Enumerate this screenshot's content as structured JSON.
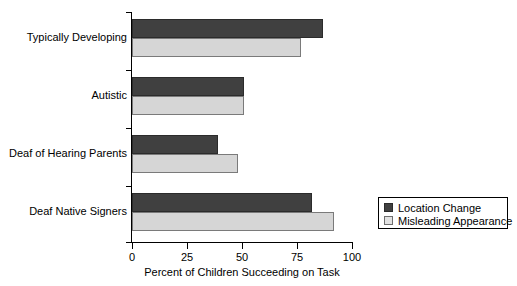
{
  "chart_data": {
    "type": "bar",
    "orientation": "horizontal",
    "title": "",
    "xlabel": "Percent of Children Succeeding on Task",
    "ylabel": "",
    "xlim": [
      0,
      100
    ],
    "xticks": [
      0,
      25,
      50,
      75,
      100
    ],
    "xtick_labels": [
      "0",
      "25",
      "50",
      "75",
      "100"
    ],
    "grid": false,
    "legend_position": "bottom-right",
    "categories": [
      "Typically Developing",
      "Autistic",
      "Deaf of Hearing Parents",
      "Deaf Native Signers"
    ],
    "series": [
      {
        "name": "Location Change",
        "color": "#404040",
        "values": [
          87,
          51,
          39,
          82
        ]
      },
      {
        "name": "Misleading Appearance",
        "color": "#d6d6d6",
        "values": [
          77,
          51,
          48,
          92
        ]
      }
    ]
  },
  "legend": {
    "items": [
      {
        "label": "Location Change",
        "swatch": "dark"
      },
      {
        "label": "Misleading Appearance",
        "swatch": "light"
      }
    ]
  },
  "axes": {
    "x_title": "Percent of Children Succeeding on Task",
    "tick_0": "0",
    "tick_1": "25",
    "tick_2": "50",
    "tick_3": "75",
    "tick_4": "100"
  },
  "categories": {
    "c0": "Typically Developing",
    "c1": "Autistic",
    "c2": "Deaf of Hearing Parents",
    "c3": "Deaf Native Signers"
  },
  "colors": {
    "dark": "#404040",
    "light": "#d6d6d6",
    "axis": "#000000",
    "background": "#ffffff"
  }
}
